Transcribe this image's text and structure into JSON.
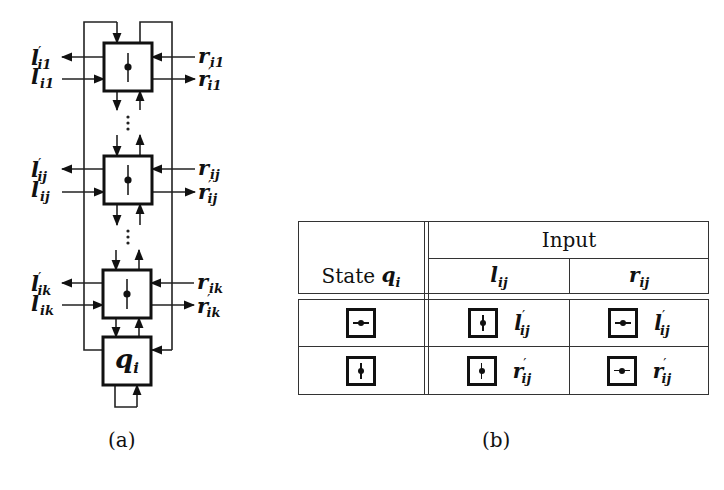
{
  "figure_a": {
    "caption": "(a)",
    "cells": [
      {
        "id": "cell-1",
        "left_out": {
          "base": "l",
          "sub": "i1",
          "prime": true
        },
        "left_in": {
          "base": "l",
          "sub": "i1",
          "prime": false
        },
        "right_in": {
          "base": "r",
          "sub": "i1",
          "prime": false
        },
        "right_out": {
          "base": "r",
          "sub": "i1",
          "prime": true
        },
        "orientation": "vertical"
      },
      {
        "id": "cell-j",
        "left_out": {
          "base": "l",
          "sub": "ij",
          "prime": true
        },
        "left_in": {
          "base": "l",
          "sub": "ij",
          "prime": false
        },
        "right_in": {
          "base": "r",
          "sub": "ij",
          "prime": false
        },
        "right_out": {
          "base": "r",
          "sub": "ij",
          "prime": true
        },
        "orientation": "vertical"
      },
      {
        "id": "cell-k",
        "left_out": {
          "base": "l",
          "sub": "ik",
          "prime": true
        },
        "left_in": {
          "base": "l",
          "sub": "ik",
          "prime": false
        },
        "right_in": {
          "base": "r",
          "sub": "ik",
          "prime": false
        },
        "right_out": {
          "base": "r",
          "sub": "ik",
          "prime": true
        },
        "orientation": "vertical"
      }
    ],
    "ellipsis": "⋮",
    "state_box": {
      "base": "q",
      "sub": "i"
    }
  },
  "figure_b": {
    "caption": "(b)",
    "header": {
      "state_col": {
        "text": "State ",
        "var": "q",
        "sub": "i"
      },
      "input_group": "Input",
      "inputs": [
        {
          "base": "l",
          "sub": "ij"
        },
        {
          "base": "r",
          "sub": "ij"
        }
      ]
    },
    "rows": [
      {
        "state": "horizontal",
        "cells": [
          {
            "next_state": "vertical",
            "output": {
              "base": "l",
              "sub": "ij",
              "prime": "′"
            }
          },
          {
            "next_state": "horizontal",
            "output": {
              "base": "l",
              "sub": "ij",
              "prime": "′"
            }
          }
        ]
      },
      {
        "state": "vertical",
        "cells": [
          {
            "next_state": "vertical",
            "output": {
              "base": "r",
              "sub": "ij",
              "prime": "′"
            }
          },
          {
            "next_state": "horizontal",
            "output": {
              "base": "r",
              "sub": "ij",
              "prime": "′"
            }
          }
        ]
      }
    ]
  },
  "labels": {
    "l": "l",
    "r": "r",
    "q": "q",
    "prime": "′",
    "i1": "i1",
    "ij": "ij",
    "ik": "ik",
    "i": "i"
  }
}
